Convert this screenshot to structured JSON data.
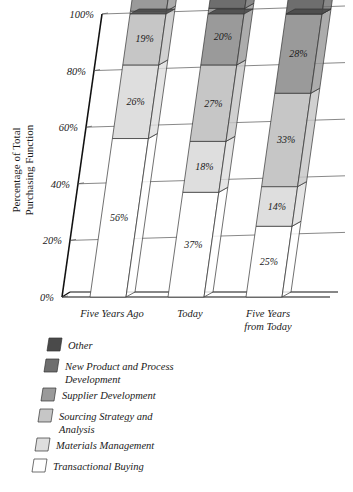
{
  "chart_data": {
    "type": "bar",
    "subtype": "stacked-bar-3d",
    "title": "",
    "xlabel": "",
    "ylabel": "Percentage of Total Purchasing Function",
    "ylabel_lines": [
      "Percentage of Total",
      "Purchasing Function"
    ],
    "ylim": [
      0,
      100
    ],
    "yticks": [
      0,
      20,
      40,
      60,
      80,
      100
    ],
    "ytick_labels": [
      "0%",
      "20%",
      "40%",
      "60%",
      "80%",
      "100%"
    ],
    "grid": true,
    "legend_position": "below",
    "stack_order": "bottom-to-top",
    "categories": [
      "Five Years Ago",
      "Today",
      "Five Years from Today"
    ],
    "category_lines": [
      [
        "Five Years Ago"
      ],
      [
        "Today"
      ],
      [
        "Five Years",
        "from Today"
      ]
    ],
    "series": [
      {
        "name": "Transactional Buying",
        "color": "#ffffff",
        "label_style": "light",
        "values": [
          56,
          37,
          25
        ],
        "value_labels": [
          "56%",
          "37%",
          "25%"
        ]
      },
      {
        "name": "Materials Management",
        "color": "#dedede",
        "label_style": "light",
        "values": [
          26,
          18,
          14
        ],
        "value_labels": [
          "26%",
          "18%",
          "14%"
        ]
      },
      {
        "name": "Sourcing Strategy and Analysis",
        "color": "#c6c6c6",
        "label_style": "light",
        "values": [
          19,
          27,
          33
        ],
        "value_labels": [
          "19%",
          "27%",
          "33%"
        ]
      },
      {
        "name": "Supplier Development",
        "color": "#9a9a9a",
        "label_style": "light",
        "values": [
          13,
          20,
          28
        ],
        "value_labels": [
          "13%",
          "20%",
          "28%"
        ]
      },
      {
        "name": "New Product and Process Development",
        "color": "#6e6e6e",
        "label_style": "dark",
        "values": [
          13,
          15,
          19
        ],
        "value_labels": [
          "13%",
          "15%",
          "19%"
        ]
      },
      {
        "name": "Other",
        "color": "#4a4a4a",
        "label_style": "dark",
        "values": [
          3,
          5,
          8
        ],
        "value_labels": [
          "3%",
          "5%",
          "8%"
        ]
      }
    ]
  },
  "legend": {
    "items": [
      {
        "label": "Other",
        "label_lines": [
          "Other"
        ],
        "color": "#4a4a4a"
      },
      {
        "label": "New Product and Process Development",
        "label_lines": [
          "New Product and Process",
          "Development"
        ],
        "color": "#6e6e6e"
      },
      {
        "label": "Supplier Development",
        "label_lines": [
          "Supplier Development"
        ],
        "color": "#9a9a9a"
      },
      {
        "label": "Sourcing Strategy and Analysis",
        "label_lines": [
          "Sourcing Strategy and",
          "Analysis"
        ],
        "color": "#c6c6c6"
      },
      {
        "label": "Materials Management",
        "label_lines": [
          "Materials Management"
        ],
        "color": "#dedede"
      },
      {
        "label": "Transactional Buying",
        "label_lines": [
          "Transactional Buying"
        ],
        "color": "#ffffff"
      }
    ]
  }
}
